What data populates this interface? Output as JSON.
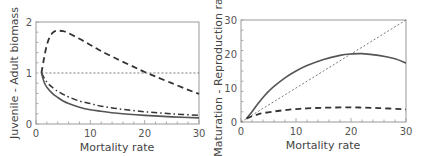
{
  "chart_data": [
    {
      "type": "line",
      "title": "",
      "xlabel": "Mortality rate",
      "ylabel": "Juvenile - Adult biomass",
      "xlim": [
        0,
        30
      ],
      "ylim": [
        0,
        2
      ],
      "xticks": [
        "0",
        "10",
        "20",
        "30"
      ],
      "yticks": [
        "0",
        "1",
        "2"
      ],
      "xtick_values": [
        0,
        10,
        20,
        30
      ],
      "ytick_values": [
        0,
        1,
        2
      ],
      "grid": false,
      "legend": null,
      "series": [
        {
          "name": "reference",
          "style": "dotted",
          "x": [
            1,
            30
          ],
          "y": [
            1,
            1
          ]
        },
        {
          "name": "dashed",
          "style": "dashed",
          "x": [
            1,
            1.5,
            2,
            2.5,
            3,
            3.5,
            4,
            5,
            6,
            8,
            10,
            12,
            15,
            18,
            20,
            22,
            25,
            28,
            30
          ],
          "y": [
            1.0,
            1.3,
            1.55,
            1.7,
            1.78,
            1.82,
            1.83,
            1.82,
            1.78,
            1.67,
            1.55,
            1.43,
            1.27,
            1.12,
            1.02,
            0.93,
            0.8,
            0.67,
            0.59
          ]
        },
        {
          "name": "dash-dot",
          "style": "dashdot",
          "x": [
            1,
            2,
            3,
            4,
            5,
            6,
            8,
            10,
            12,
            15,
            20,
            25,
            30
          ],
          "y": [
            1.0,
            0.82,
            0.72,
            0.64,
            0.58,
            0.53,
            0.45,
            0.4,
            0.35,
            0.3,
            0.24,
            0.2,
            0.17
          ]
        },
        {
          "name": "solid",
          "style": "solid",
          "x": [
            1,
            1.5,
            2,
            3,
            4,
            5,
            6,
            8,
            10,
            12,
            15,
            20,
            25,
            30
          ],
          "y": [
            1.0,
            0.82,
            0.72,
            0.6,
            0.52,
            0.45,
            0.4,
            0.33,
            0.28,
            0.25,
            0.21,
            0.17,
            0.14,
            0.12
          ]
        }
      ]
    },
    {
      "type": "line",
      "title": "",
      "xlabel": "Mortality rate",
      "ylabel": "Maturation - Reproduction rate",
      "xlim": [
        0,
        30
      ],
      "ylim": [
        0,
        30
      ],
      "xticks": [
        "0",
        "10",
        "20",
        "30"
      ],
      "yticks": [
        "0",
        "10",
        "20",
        "30"
      ],
      "xtick_values": [
        0,
        10,
        20,
        30
      ],
      "ytick_values": [
        0,
        10,
        20,
        30
      ],
      "grid": false,
      "legend": null,
      "series": [
        {
          "name": "reference",
          "style": "dotted",
          "x": [
            0,
            30
          ],
          "y": [
            0,
            30
          ]
        },
        {
          "name": "solid",
          "style": "solid",
          "x": [
            1,
            2,
            3,
            4,
            5,
            6,
            8,
            10,
            12,
            15,
            18,
            20,
            22,
            25,
            28,
            30
          ],
          "y": [
            1,
            3,
            5.2,
            7.2,
            9,
            10.5,
            13,
            15,
            16.6,
            18.4,
            19.6,
            20,
            20.1,
            19.6,
            18.6,
            17.3
          ]
        },
        {
          "name": "dashed",
          "style": "dashed",
          "x": [
            1,
            2,
            3,
            4,
            6,
            8,
            10,
            12,
            15,
            20,
            25,
            30
          ],
          "y": [
            1,
            1.7,
            2.2,
            2.6,
            3.1,
            3.5,
            3.8,
            4.0,
            4.2,
            4.3,
            4.1,
            3.7
          ]
        }
      ]
    }
  ]
}
